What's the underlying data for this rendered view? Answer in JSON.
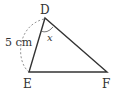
{
  "diagram": {
    "type": "triangle",
    "vertices": {
      "D": {
        "label": "D"
      },
      "E": {
        "label": "E"
      },
      "F": {
        "label": "F"
      }
    },
    "side_label": "5 cm",
    "angle_label": "x",
    "colors": {
      "line": "#333333",
      "dashed": "#888888"
    }
  }
}
